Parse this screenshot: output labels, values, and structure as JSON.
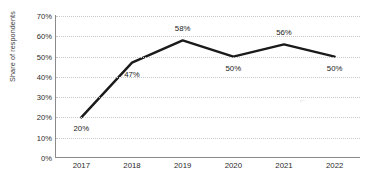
{
  "chart_data": {
    "type": "line",
    "title": "",
    "xlabel": "",
    "ylabel": "Share of respondents",
    "categories": [
      "2017",
      "2018",
      "2019",
      "2020",
      "2021",
      "2022"
    ],
    "values": [
      20,
      47,
      58,
      50,
      56,
      50
    ],
    "point_labels": [
      "20%",
      "47%",
      "58%",
      "50%",
      "56%",
      "50%"
    ],
    "label_positions": [
      "below",
      "below",
      "above",
      "below",
      "above",
      "below"
    ],
    "ylim": [
      0,
      70
    ],
    "ytick_values": [
      0,
      10,
      20,
      30,
      40,
      50,
      60,
      70
    ],
    "ytick_labels": [
      "0%",
      "10%",
      "20%",
      "30%",
      "40%",
      "50%",
      "60%",
      "70%"
    ],
    "grid": "horizontal-dotted",
    "legend": "none",
    "series": [
      {
        "name": "Share of respondents",
        "values": [
          20,
          47,
          58,
          50,
          56,
          50
        ]
      }
    ],
    "colors": {
      "line": "#1a1a1a",
      "grid": "#c8c8c8",
      "axis": "#8a8a8a",
      "text": "#2b2b2b",
      "background": "#ffffff"
    }
  },
  "artifact": {
    "mark": "⌐"
  }
}
